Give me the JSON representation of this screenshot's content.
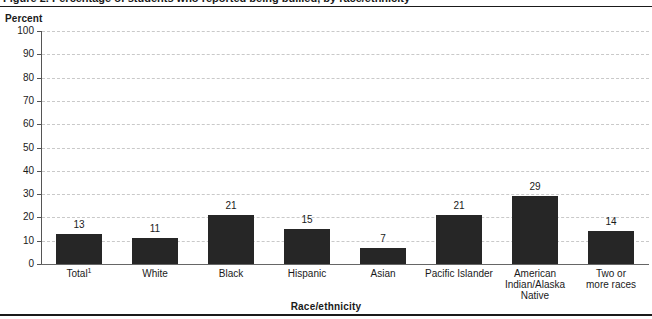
{
  "figure": {
    "title": "Figure 2.  Percentage of students who reported being bullied, by race/ethnicity",
    "y_axis_caption": "Percent",
    "x_axis_title": "Race/ethnicity"
  },
  "chart_data": {
    "type": "bar",
    "title": "Figure 2.  Percentage of students who reported being bullied, by race/ethnicity",
    "xlabel": "Race/ethnicity",
    "ylabel": "Percent",
    "ylim": [
      0,
      100
    ],
    "ytick_step": 10,
    "grid": true,
    "legend": "none",
    "bar_color": "#262626",
    "categories": [
      "Total¹",
      "White",
      "Black",
      "Hispanic",
      "Asian",
      "Pacific Islander",
      "American Indian/Alaska Native",
      "Two or more races"
    ],
    "category_lines": [
      [
        "Total",
        "White",
        "Black",
        "Hispanic",
        "Asian",
        "Pacific Islander",
        "American",
        "Two or"
      ],
      [
        "",
        "",
        "",
        "",
        "",
        "",
        "Indian/Alaska",
        "more races"
      ],
      [
        "",
        "",
        "",
        "",
        "",
        "",
        "Native",
        ""
      ]
    ],
    "values": [
      13,
      11,
      21,
      15,
      7,
      21,
      29,
      14
    ],
    "value_labels": [
      "13",
      "11",
      "21",
      "15",
      "7",
      "21",
      "29",
      "14"
    ],
    "yticks": [
      0,
      10,
      20,
      30,
      40,
      50,
      60,
      70,
      80,
      90,
      100
    ],
    "ytick_labels": [
      "0",
      "10",
      "20",
      "30",
      "40",
      "50",
      "60",
      "70",
      "80",
      "90",
      "100"
    ],
    "footnote_marker": "1"
  }
}
